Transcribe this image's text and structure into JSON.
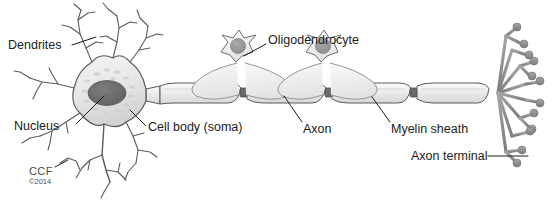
{
  "figure": {
    "background_color": "#ffffff",
    "line_color": "#5a5a5a",
    "label_color": "#1b1b1b"
  },
  "labels": {
    "dendrites": "Dendrites",
    "nucleus": "Nucleus",
    "cell_body": "Cell body (soma)",
    "oligodendrocyte": "Oligodendrocyte",
    "axon": "Axon",
    "myelin_sheath": "Myelin sheath",
    "axon_terminal": "Axon terminal"
  },
  "credit": {
    "mark": "CCF",
    "copyright": "©2014"
  },
  "structures": {
    "soma_fill": "#e9e9e9",
    "nucleus_fill": "#6e6e6e",
    "myelin_fill": "#f0f0f0",
    "oligodendrocyte_nucleus_fill": "#9a9a9a",
    "terminal_fill": "#8d8d8d",
    "node_fill": "#5a5a5a",
    "myelin_segment_count": 4,
    "oligodendrocyte_count": 2,
    "terminal_branch_count": 11
  }
}
